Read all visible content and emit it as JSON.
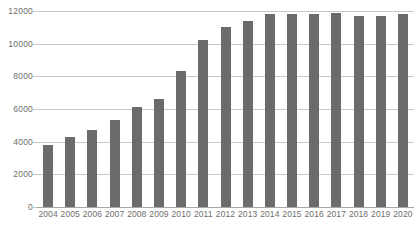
{
  "chart_data": {
    "type": "bar",
    "title": "",
    "subtitle": "",
    "xlabel": "",
    "ylabel": "",
    "categories": [
      "2004",
      "2005",
      "2006",
      "2007",
      "2008",
      "2009",
      "2010",
      "2011",
      "2012",
      "2013",
      "2014",
      "2015",
      "2016",
      "2017",
      "2018",
      "2019",
      "2020"
    ],
    "values": [
      3800,
      4300,
      4700,
      5300,
      6100,
      6600,
      8300,
      10200,
      11000,
      11400,
      11800,
      11800,
      11800,
      11900,
      11700,
      11700,
      11800
    ],
    "ylim": [
      0,
      12000
    ],
    "yticks": [
      0,
      2000,
      4000,
      6000,
      8000,
      10000,
      12000
    ],
    "ytick_labels": [
      "0",
      "2000",
      "4000",
      "6000",
      "8000",
      "10000",
      "12000"
    ],
    "grid": true,
    "legend": false,
    "legend_position": "none",
    "series": [
      {
        "name": "",
        "values": [
          3800,
          4300,
          4700,
          5300,
          6100,
          6600,
          8300,
          10200,
          11000,
          11400,
          11800,
          11800,
          11800,
          11900,
          11700,
          11700,
          11800
        ]
      }
    ]
  },
  "style": {
    "bar_color": "#6b6b6b",
    "grid_color": "#c9c9c9",
    "axis_color": "#a8a8a8",
    "tick_label_color": "#6e6e6e",
    "background": "#ffffff"
  }
}
